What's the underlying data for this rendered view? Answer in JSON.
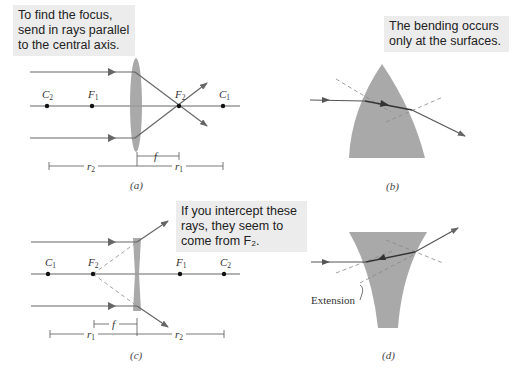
{
  "panels": {
    "a": {
      "caption": "(a)",
      "callout": [
        "To find the focus,",
        "send in rays parallel",
        "to the central axis."
      ],
      "points": [
        {
          "label": "C",
          "sub": "2",
          "x": 47
        },
        {
          "label": "F",
          "sub": "1",
          "x": 92
        },
        {
          "label": "F",
          "sub": "2",
          "x": 179
        },
        {
          "label": "C",
          "sub": "1",
          "x": 223
        }
      ],
      "dims": {
        "f": "f",
        "r_left": "r",
        "r_left_sub": "2",
        "r_right": "r",
        "r_right_sub": "1"
      }
    },
    "b": {
      "caption": "(b)",
      "callout": [
        "The bending occurs",
        "only at the surfaces."
      ]
    },
    "c": {
      "caption": "(c)",
      "callout": [
        "If you intercept these",
        "rays, they seem to",
        "come from F₂."
      ],
      "points": [
        {
          "label": "C",
          "sub": "1",
          "x": 48
        },
        {
          "label": "F",
          "sub": "2",
          "x": 93
        },
        {
          "label": "F",
          "sub": "1",
          "x": 180
        },
        {
          "label": "C",
          "sub": "2",
          "x": 224
        }
      ],
      "dims": {
        "f": "f",
        "r_left": "r",
        "r_left_sub": "1",
        "r_right": "r",
        "r_right_sub": "2"
      }
    },
    "d": {
      "caption": "(d)",
      "annotation": "Extension"
    }
  },
  "colors": {
    "ray": "#666666",
    "lens": "#9a9a9a",
    "glass": "#a9a9a9",
    "callout_bg": "#ececec",
    "dashed": "#888888"
  }
}
